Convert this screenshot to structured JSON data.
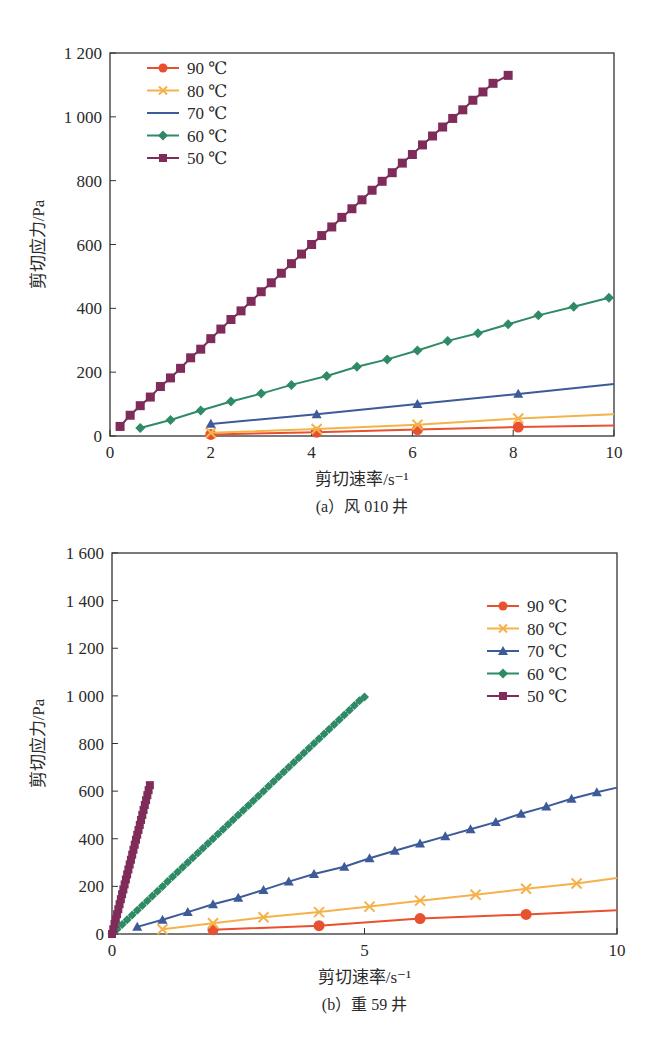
{
  "chart_data": [
    {
      "type": "line",
      "id": "a",
      "title": "",
      "caption": "(a）风 010 井",
      "xlabel": "剪切速率/s⁻¹",
      "ylabel": "剪切应力/Pa",
      "xlim": [
        0,
        10
      ],
      "ylim": [
        0,
        1200
      ],
      "xticks": [
        0,
        2,
        4,
        6,
        8,
        10
      ],
      "xtick_labels": [
        "0",
        "2",
        "4",
        "6",
        "8",
        "10"
      ],
      "yticks": [
        0,
        200,
        400,
        600,
        800,
        1000,
        1200
      ],
      "ytick_labels": [
        "0",
        "200",
        "400",
        "600",
        "800",
        "1 000",
        "1 200"
      ],
      "grid": false,
      "legend_position": "upper-left",
      "series": [
        {
          "name": "90 ℃",
          "color": "#e8502f",
          "marker": "circle",
          "x": [
            2.0,
            4.1,
            6.1,
            8.1,
            10.0
          ],
          "y": [
            5,
            12,
            20,
            28,
            33
          ]
        },
        {
          "name": "80 ℃",
          "color": "#f5b24a",
          "marker": "x",
          "x": [
            2.0,
            4.1,
            6.1,
            8.1,
            10.0
          ],
          "y": [
            10,
            22,
            35,
            55,
            68
          ]
        },
        {
          "name": "70 ℃",
          "color": "#3d5a99",
          "marker": "triangle",
          "x": [
            2.0,
            4.1,
            6.1,
            8.1,
            10.0
          ],
          "y": [
            38,
            68,
            100,
            132,
            163
          ]
        },
        {
          "name": "60 ℃",
          "color": "#2f8a66",
          "marker": "diamond",
          "x": [
            0.6,
            1.2,
            1.8,
            2.4,
            3.0,
            3.6,
            4.3,
            4.9,
            5.5,
            6.1,
            6.7,
            7.3,
            7.9,
            8.5,
            9.2,
            9.9
          ],
          "y": [
            25,
            50,
            80,
            108,
            133,
            160,
            188,
            217,
            240,
            268,
            298,
            322,
            350,
            378,
            405,
            433
          ]
        },
        {
          "name": "50 ℃",
          "color": "#7f2c5a",
          "marker": "square",
          "x": [
            0.2,
            0.4,
            0.6,
            0.8,
            1.0,
            1.2,
            1.4,
            1.6,
            1.8,
            2.0,
            2.2,
            2.4,
            2.6,
            2.8,
            3.0,
            3.2,
            3.4,
            3.6,
            3.8,
            4.0,
            4.2,
            4.4,
            4.6,
            4.8,
            5.0,
            5.2,
            5.4,
            5.6,
            5.8,
            6.0,
            6.2,
            6.4,
            6.6,
            6.8,
            7.0,
            7.2,
            7.4,
            7.6,
            7.9
          ],
          "y": [
            30,
            65,
            95,
            122,
            155,
            182,
            212,
            245,
            272,
            305,
            335,
            365,
            392,
            422,
            452,
            480,
            510,
            540,
            570,
            600,
            628,
            655,
            685,
            712,
            740,
            770,
            798,
            825,
            855,
            882,
            912,
            940,
            968,
            995,
            1022,
            1052,
            1078,
            1105,
            1130
          ]
        }
      ]
    },
    {
      "type": "line",
      "id": "b",
      "title": "",
      "caption": "(b）重 59 井",
      "xlabel": "剪切速率/s⁻¹",
      "ylabel": "剪切应力/Pa",
      "xlim": [
        0,
        10
      ],
      "ylim": [
        0,
        1600
      ],
      "xticks": [
        0,
        5,
        10
      ],
      "xtick_labels": [
        "0",
        "5",
        "10"
      ],
      "yticks": [
        0,
        200,
        400,
        600,
        800,
        1000,
        1200,
        1400,
        1600
      ],
      "ytick_labels": [
        "0",
        "200",
        "400",
        "600",
        "800",
        "1 000",
        "1 200",
        "1 400",
        "1 600"
      ],
      "grid": false,
      "legend_position": "upper-right",
      "series": [
        {
          "name": "90 ℃",
          "color": "#e8502f",
          "marker": "circle",
          "x": [
            2.0,
            4.1,
            6.1,
            8.2,
            10.0
          ],
          "y": [
            18,
            35,
            65,
            82,
            100
          ]
        },
        {
          "name": "80 ℃",
          "color": "#f5b24a",
          "marker": "x",
          "x": [
            1.0,
            2.0,
            3.0,
            4.1,
            5.1,
            6.1,
            7.2,
            8.2,
            9.2,
            10.0
          ],
          "y": [
            20,
            45,
            70,
            92,
            115,
            140,
            165,
            190,
            212,
            235
          ]
        },
        {
          "name": "70 ℃",
          "color": "#3d5a99",
          "marker": "triangle",
          "x": [
            0.5,
            1.0,
            1.5,
            2.0,
            2.5,
            3.0,
            3.5,
            4.0,
            4.6,
            5.1,
            5.6,
            6.1,
            6.6,
            7.1,
            7.6,
            8.1,
            8.6,
            9.1,
            9.6,
            10.0
          ],
          "y": [
            30,
            60,
            92,
            125,
            152,
            185,
            220,
            252,
            282,
            318,
            350,
            380,
            410,
            440,
            470,
            505,
            535,
            568,
            595,
            615
          ]
        },
        {
          "name": "60 ℃",
          "color": "#2f8a66",
          "marker": "diamond",
          "x": [
            0.0,
            0.1,
            0.2,
            0.3,
            0.4,
            0.5,
            0.6,
            0.7,
            0.8,
            0.9,
            1.0,
            1.1,
            1.2,
            1.3,
            1.4,
            1.5,
            1.6,
            1.7,
            1.8,
            1.9,
            2.0,
            2.1,
            2.2,
            2.3,
            2.4,
            2.5,
            2.6,
            2.7,
            2.8,
            2.9,
            3.0,
            3.1,
            3.2,
            3.3,
            3.4,
            3.5,
            3.6,
            3.7,
            3.8,
            3.9,
            4.0,
            4.1,
            4.2,
            4.3,
            4.4,
            4.5,
            4.6,
            4.7,
            4.8,
            4.9,
            5.0
          ],
          "y": [
            0,
            20,
            40,
            60,
            80,
            100,
            120,
            140,
            160,
            180,
            200,
            220,
            240,
            260,
            280,
            300,
            320,
            340,
            360,
            380,
            400,
            420,
            440,
            460,
            480,
            500,
            520,
            540,
            560,
            580,
            600,
            620,
            640,
            660,
            680,
            700,
            720,
            740,
            760,
            780,
            800,
            820,
            840,
            860,
            880,
            900,
            920,
            940,
            960,
            980,
            995
          ]
        },
        {
          "name": "50 ℃",
          "color": "#7f2c5a",
          "marker": "square",
          "x": [
            0.0,
            0.025,
            0.05,
            0.075,
            0.1,
            0.125,
            0.15,
            0.175,
            0.2,
            0.225,
            0.25,
            0.275,
            0.3,
            0.325,
            0.35,
            0.375,
            0.4,
            0.425,
            0.45,
            0.475,
            0.5,
            0.525,
            0.55,
            0.575,
            0.6,
            0.625,
            0.65,
            0.675,
            0.7,
            0.725,
            0.75
          ],
          "y": [
            0,
            20,
            42,
            62,
            83,
            104,
            125,
            146,
            167,
            187,
            208,
            229,
            250,
            271,
            292,
            312,
            333,
            354,
            375,
            396,
            417,
            437,
            458,
            479,
            500,
            521,
            542,
            562,
            583,
            604,
            625
          ]
        }
      ]
    }
  ]
}
